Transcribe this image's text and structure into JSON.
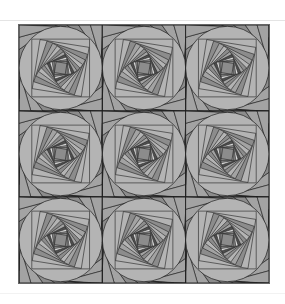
{
  "artwork": {
    "kind": "spiral-square tessellation",
    "grid": {
      "rows": 3,
      "cols": 3
    },
    "frame": {
      "x": 18,
      "y": 24,
      "width": 252,
      "height": 260
    },
    "palette": {
      "darkest": "#4f4f4f",
      "dark": "#6e6e6e",
      "mid": "#8c8c8c",
      "light": "#a3a3a3",
      "lighter": "#b4b4b4",
      "highlight": "#dcdcdc",
      "line": "#1e1e1e"
    },
    "spiral": {
      "layers": 11,
      "rotation_deg": 9,
      "scale": 0.86
    },
    "fan_lines_per_side": 7
  }
}
